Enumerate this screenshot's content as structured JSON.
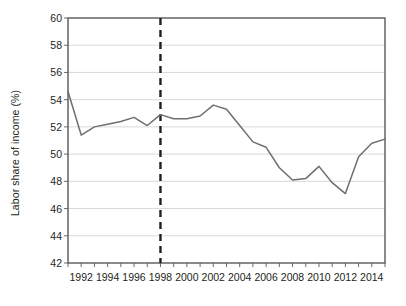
{
  "chart_data": {
    "type": "line",
    "title": "",
    "xlabel": "",
    "ylabel": "Labor share of income (%)",
    "xlim": [
      1991,
      2015
    ],
    "ylim": [
      42,
      60
    ],
    "ytick_step": 2,
    "grid": true,
    "legend": "none",
    "x_tick_labels": [
      "1992",
      "1994",
      "1996",
      "1998",
      "2000",
      "2002",
      "2004",
      "2006",
      "2008",
      "2010",
      "2012",
      "2014"
    ],
    "x_tick_values": [
      1992,
      1994,
      1996,
      1998,
      2000,
      2002,
      2004,
      2006,
      2008,
      2010,
      2012,
      2014
    ],
    "x_minor_ticks": [
      1991,
      1992,
      1993,
      1994,
      1995,
      1996,
      1997,
      1998,
      1999,
      2000,
      2001,
      2002,
      2003,
      2004,
      2005,
      2006,
      2007,
      2008,
      2009,
      2010,
      2011,
      2012,
      2013,
      2014,
      2015
    ],
    "y_tick_labels": [
      "42",
      "44",
      "46",
      "48",
      "50",
      "52",
      "54",
      "56",
      "58",
      "60"
    ],
    "y_tick_values": [
      42,
      44,
      46,
      48,
      50,
      52,
      54,
      56,
      58,
      60
    ],
    "annotations": [
      {
        "type": "vline",
        "name": "reference-line-1998",
        "x": 1998,
        "style": "dashed",
        "color": "#231f20"
      }
    ],
    "series": [
      {
        "name": "Labor share of income",
        "color": "#6d6e70",
        "x": [
          1991,
          1992,
          1993,
          1994,
          1995,
          1996,
          1997,
          1998,
          1999,
          2000,
          2001,
          2002,
          2003,
          2004,
          2005,
          2006,
          2007,
          2008,
          2009,
          2010,
          2011,
          2012,
          2013,
          2014,
          2015
        ],
        "values": [
          54.6,
          51.4,
          52.0,
          52.2,
          52.4,
          52.7,
          52.1,
          52.9,
          52.6,
          52.6,
          52.8,
          53.6,
          53.3,
          52.1,
          50.9,
          50.5,
          49.0,
          48.1,
          48.2,
          49.1,
          47.9,
          47.1,
          49.8,
          50.8,
          51.1
        ]
      }
    ]
  }
}
